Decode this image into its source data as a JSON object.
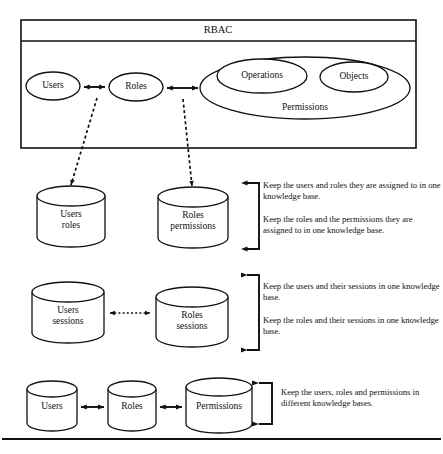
{
  "diagram": {
    "title": "RBAC",
    "rbac_box": {
      "header_label": "RBAC",
      "nodes": {
        "users": "Users",
        "roles": "Roles",
        "operations": "Operations",
        "objects": "Objects",
        "permissions": "Permissions"
      }
    },
    "rows": [
      {
        "id": "row-assignments",
        "stores": [
          {
            "line1": "Users",
            "line2": "roles"
          },
          {
            "line1": "Roles",
            "line2": "permissions"
          }
        ],
        "notes": [
          "Keep the users and roles they are assigned to in one knowledge base.",
          "Keep the roles and the permissions they are assigned to in one knowledge base."
        ]
      },
      {
        "id": "row-sessions",
        "stores": [
          {
            "line1": "Users",
            "line2": "sessions"
          },
          {
            "line1": "Roles",
            "line2": "sessions"
          }
        ],
        "notes": [
          "Keep the users and their sessions in one knowledge base.",
          "Keep the roles and their sessions in one knowledge base."
        ]
      },
      {
        "id": "row-separate",
        "stores": [
          {
            "line1": "Users",
            "line2": ""
          },
          {
            "line1": "Roles",
            "line2": ""
          },
          {
            "line1": "Permissions",
            "line2": ""
          }
        ],
        "notes": [
          "Keep the users, roles and permissions in different knowledge bases."
        ]
      }
    ],
    "colors": {
      "stroke": "#111111",
      "fill": "#ffffff",
      "background": "#ffffff"
    }
  }
}
